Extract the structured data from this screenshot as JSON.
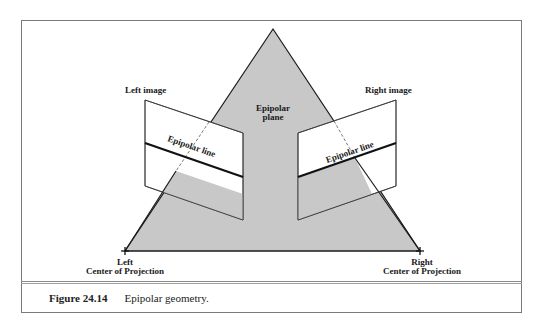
{
  "figure": {
    "number": "Figure 24.14",
    "caption": "Epipolar geometry."
  },
  "labels": {
    "epipolar_plane_line1": "Epipolar",
    "epipolar_plane_line2": "plane",
    "left_image": "Left image",
    "right_image": "Right image",
    "left_epipolar_line": "Epipolar line",
    "right_epipolar_line": "Epipolar line",
    "left_cop_line1": "Left",
    "left_cop_line2": "Center of Projection",
    "right_cop_line1": "Right",
    "right_cop_line2": "Center of Projection"
  },
  "colors": {
    "plane_fill": "#c8c8c8",
    "stroke": "#1a1a1a",
    "frame": "#7a7a7a",
    "image_fill": "#ffffff"
  }
}
